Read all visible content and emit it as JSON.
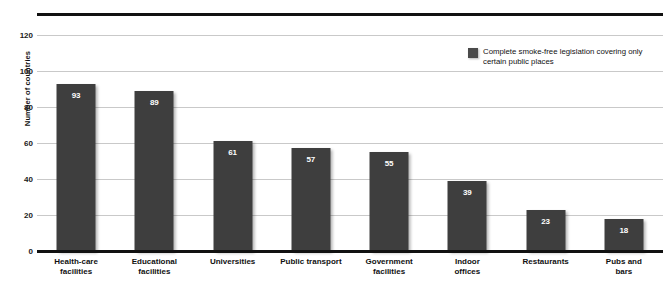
{
  "chart_data": {
    "type": "bar",
    "title": "",
    "subtitle": "",
    "xlabel": "",
    "ylabel": "Number of countries",
    "ylim": [
      0,
      120
    ],
    "ytick_step": 20,
    "yticks": [
      120,
      100,
      80,
      60,
      40,
      20,
      0
    ],
    "grid": true,
    "legend_position": "top-right",
    "categories": [
      "Health-care facilities",
      "Educational facilities",
      "Universities",
      "Public transport",
      "Government facilities",
      "Indoor offices",
      "Restaurants",
      "Pubs and bars"
    ],
    "category_lines": [
      [
        "Health-care",
        "facilities"
      ],
      [
        "Educational",
        "facilities"
      ],
      [
        "Universities",
        ""
      ],
      [
        "Public transport",
        ""
      ],
      [
        "Government",
        "facilities"
      ],
      [
        "Indoor",
        "offices"
      ],
      [
        "Restaurants",
        ""
      ],
      [
        "Pubs and",
        "bars"
      ]
    ],
    "values": [
      93,
      89,
      61,
      57,
      55,
      39,
      23,
      18
    ],
    "series": [
      {
        "name": "Complete smoke-free legislation covering only certain public places",
        "values": [
          93,
          89,
          61,
          57,
          55,
          39,
          23,
          18
        ],
        "color": "#3e3e3e"
      }
    ],
    "legend": [
      {
        "label_line1": "Complete smoke-free legislation covering only",
        "label_line2": "certain public places",
        "color": "#4a4a4a"
      }
    ],
    "colors": {
      "bar": "#3e3e3e",
      "gridline": "#c9c9c9",
      "axis": "#111111",
      "value_label": "#ffffff",
      "background": "#ffffff"
    }
  }
}
